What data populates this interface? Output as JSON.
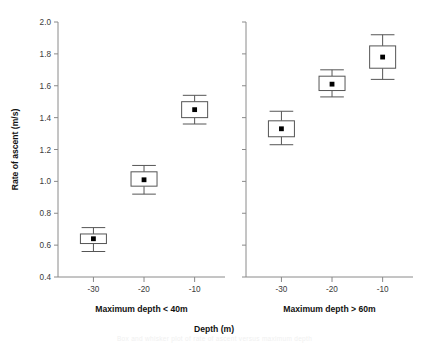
{
  "figure": {
    "xlabel": "Depth (m)",
    "ylabel": "Rate of ascent (m/s)",
    "caption_fragment": "Box and whisker plot of rate of ascent versus maximum depth"
  },
  "chart_data": {
    "type": "box",
    "title": "",
    "xlabel": "Depth (m)",
    "ylabel": "Rate of ascent (m/s)",
    "ylim": [
      0.4,
      2.0
    ],
    "ytick_step": 0.2,
    "yticks": [
      "0.4",
      "0.6",
      "0.8",
      "1.0",
      "1.2",
      "1.4",
      "1.6",
      "1.8",
      "2.0"
    ],
    "ytick_values": [
      0.4,
      0.6,
      0.8,
      1.0,
      1.2,
      1.4,
      1.6,
      1.8,
      2.0
    ],
    "grid": false,
    "legend": "none",
    "xticks": [
      "-30",
      "-20",
      "-10"
    ],
    "xtick_values": [
      -30,
      -20,
      -10
    ],
    "xlim": [
      -37,
      -4
    ],
    "panels": [
      {
        "name": "panel-left",
        "title": "Maximum depth < 40m",
        "categories": [
          "-30",
          "-20",
          "-10"
        ],
        "boxes": [
          {
            "x": -30,
            "whisker_low": 0.56,
            "q1": 0.61,
            "median": 0.64,
            "q3": 0.67,
            "whisker_high": 0.71
          },
          {
            "x": -20,
            "whisker_low": 0.92,
            "q1": 0.97,
            "median": 1.01,
            "q3": 1.06,
            "whisker_high": 1.1
          },
          {
            "x": -10,
            "whisker_low": 1.36,
            "q1": 1.4,
            "median": 1.45,
            "q3": 1.5,
            "whisker_high": 1.54
          }
        ]
      },
      {
        "name": "panel-right",
        "title": "Maximum depth > 60m",
        "categories": [
          "-30",
          "-20",
          "-10"
        ],
        "boxes": [
          {
            "x": -30,
            "whisker_low": 1.23,
            "q1": 1.28,
            "median": 1.33,
            "q3": 1.38,
            "whisker_high": 1.44
          },
          {
            "x": -20,
            "whisker_low": 1.53,
            "q1": 1.57,
            "median": 1.61,
            "q3": 1.66,
            "whisker_high": 1.7
          },
          {
            "x": -10,
            "whisker_low": 1.64,
            "q1": 1.71,
            "median": 1.78,
            "q3": 1.85,
            "whisker_high": 1.92
          }
        ]
      }
    ],
    "colors": {
      "axis": "#8a8a8a",
      "box_stroke": "#555555",
      "box_fill": "#ffffff",
      "median_marker": "#000000",
      "text": "#111111"
    }
  }
}
